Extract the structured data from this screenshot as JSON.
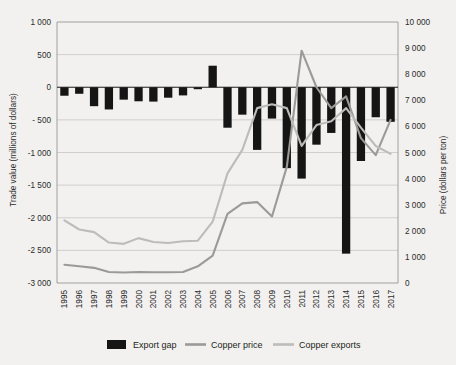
{
  "chart_data": {
    "type": "bar",
    "title": "",
    "subtitle": "",
    "xlabel": "",
    "ylabel": "Trade value (millions of dollars)",
    "y2label": "Price (dollars per ton)",
    "grid": true,
    "legend_position": "bottom",
    "ylim": [
      -3000,
      1000
    ],
    "y2lim": [
      0,
      10000
    ],
    "yticks": [
      "1 000",
      "500",
      "0",
      "- 500",
      "-1 000",
      "-1 500",
      "-2 000",
      "-2 500",
      "-3 000"
    ],
    "ytick_values": [
      1000,
      500,
      0,
      -500,
      -1000,
      -1500,
      -2000,
      -2500,
      -3000
    ],
    "y2ticks": [
      "10 000",
      "9 000",
      "8 000",
      "7 000",
      "6 000",
      "5 000",
      "4 000",
      "3 000",
      "2 000",
      "1 000",
      "0"
    ],
    "y2tick_values": [
      10000,
      9000,
      8000,
      7000,
      6000,
      5000,
      4000,
      3000,
      2000,
      1000,
      0
    ],
    "categories": [
      "1995",
      "1996",
      "1997",
      "1998",
      "1999",
      "2000",
      "2001",
      "2002",
      "2003",
      "2004",
      "2005",
      "2006",
      "2007",
      "2008",
      "2009",
      "2010",
      "2011",
      "2012",
      "2013",
      "2014",
      "2015",
      "2016",
      "2017"
    ],
    "series": [
      {
        "name": "Export gap",
        "type": "bar",
        "axis": "left",
        "unit": "millions of dollars",
        "color": "#151515",
        "values": [
          -130,
          -100,
          -290,
          -340,
          -190,
          -215,
          -220,
          -160,
          -125,
          -30,
          330,
          -620,
          -420,
          -960,
          -480,
          -1240,
          -1400,
          -880,
          -700,
          -2550,
          -1130,
          -460,
          -530
        ]
      },
      {
        "name": "Copper price",
        "type": "line",
        "axis": "right",
        "unit": "dollars per ton",
        "color": "#9a9a98",
        "values": [
          700,
          640,
          580,
          420,
          400,
          420,
          410,
          410,
          420,
          640,
          1050,
          2650,
          3050,
          3100,
          2550,
          4450,
          8900,
          7500,
          6700,
          7150,
          5550,
          4900,
          6250
        ]
      },
      {
        "name": "Copper exports",
        "type": "line",
        "axis": "right",
        "unit": "dollars per ton",
        "color": "#bcbcba",
        "values": [
          2400,
          2050,
          1950,
          1550,
          1500,
          1720,
          1570,
          1530,
          1600,
          1620,
          2350,
          4200,
          5100,
          6700,
          6850,
          6700,
          5250,
          6050,
          6200,
          6700,
          5950,
          5250,
          4950
        ]
      }
    ],
    "legend": [
      {
        "label": "Export gap",
        "marker": "bar-swatch",
        "color": "#151515"
      },
      {
        "label": "Copper price",
        "marker": "line-swatch",
        "color": "#9a9a98"
      },
      {
        "label": "Copper exports",
        "marker": "line-swatch",
        "color": "#bcbcba"
      }
    ]
  }
}
